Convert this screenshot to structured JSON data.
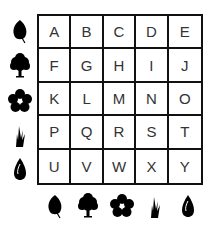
{
  "grid": {
    "rows": [
      [
        "A",
        "B",
        "C",
        "D",
        "E"
      ],
      [
        "F",
        "G",
        "H",
        "I",
        "J"
      ],
      [
        "K",
        "L",
        "M",
        "N",
        "O"
      ],
      [
        "P",
        "Q",
        "R",
        "S",
        "T"
      ],
      [
        "U",
        "V",
        "W",
        "X",
        "Y"
      ]
    ]
  },
  "row_icons": [
    "leaf-icon",
    "tree-icon",
    "flower-icon",
    "grass-icon",
    "seed-icon"
  ],
  "column_icons": [
    "leaf-icon",
    "tree-icon",
    "flower-icon",
    "grass-icon",
    "seed-icon"
  ],
  "colors": {
    "line": "#111111",
    "text": "#333333",
    "icon": "#000000"
  }
}
